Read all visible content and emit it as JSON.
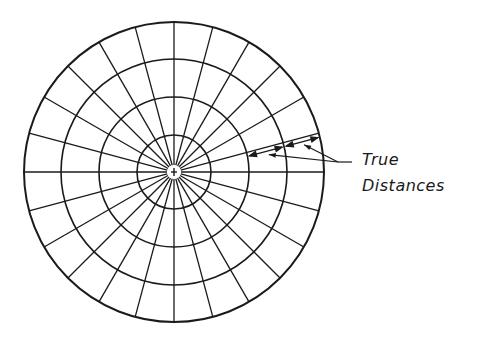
{
  "diagram": {
    "colors": {
      "stroke": "#1a1a1a",
      "background": "#ffffff"
    },
    "center": {
      "x": 174,
      "y": 172
    },
    "circle_radii": [
      37,
      75,
      113,
      150
    ],
    "radial_line_count": 24,
    "radial_step_degrees": 15,
    "center_marker": "plus",
    "annotation": {
      "line1": "True",
      "line2": "Distances",
      "note": "Arrows along a radial line mark equal spacing between concentric circles"
    }
  }
}
